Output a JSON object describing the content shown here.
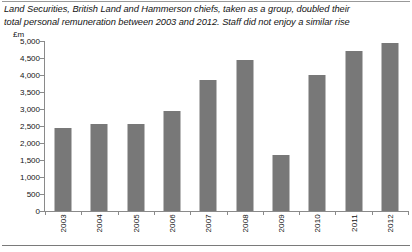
{
  "caption": {
    "line1": "Land Securities, British Land and Hammerson chiefs, taken as a group, doubled their",
    "line2": "total personal remuneration between 2003 and 2012. Staff did not enjoy a similar rise"
  },
  "axis": {
    "unit_label": "£m"
  },
  "colors": {
    "bar": "#787878",
    "axis": "#8a8a8a",
    "text": "#141414",
    "rule": "#999999"
  },
  "chart_data": {
    "type": "bar",
    "title": "Land Securities, British Land and Hammerson chiefs, taken as a group, doubled their total personal remuneration between 2003 and 2012. Staff did not enjoy a similar rise",
    "xlabel": "",
    "ylabel": "£m",
    "categories": [
      "2003",
      "2004",
      "2005",
      "2006",
      "2007",
      "2008",
      "2009",
      "2010",
      "2011",
      "2012"
    ],
    "values": [
      2450,
      2550,
      2560,
      2950,
      3850,
      4450,
      1650,
      4000,
      4700,
      4950
    ],
    "ylim": [
      0,
      5000
    ],
    "ytick_values": [
      0,
      500,
      1000,
      1500,
      2000,
      2500,
      3000,
      3500,
      4000,
      4500,
      5000
    ],
    "ytick_labels": [
      "0",
      "500",
      "1,000",
      "1,500",
      "2,000",
      "2,500",
      "3,000",
      "3,500",
      "4,000",
      "4,500",
      "5,000"
    ],
    "grid": false,
    "legend": false,
    "series": [
      {
        "name": "Total personal remuneration",
        "values": [
          2450,
          2550,
          2560,
          2950,
          3850,
          4450,
          1650,
          4000,
          4700,
          4950
        ]
      }
    ]
  }
}
